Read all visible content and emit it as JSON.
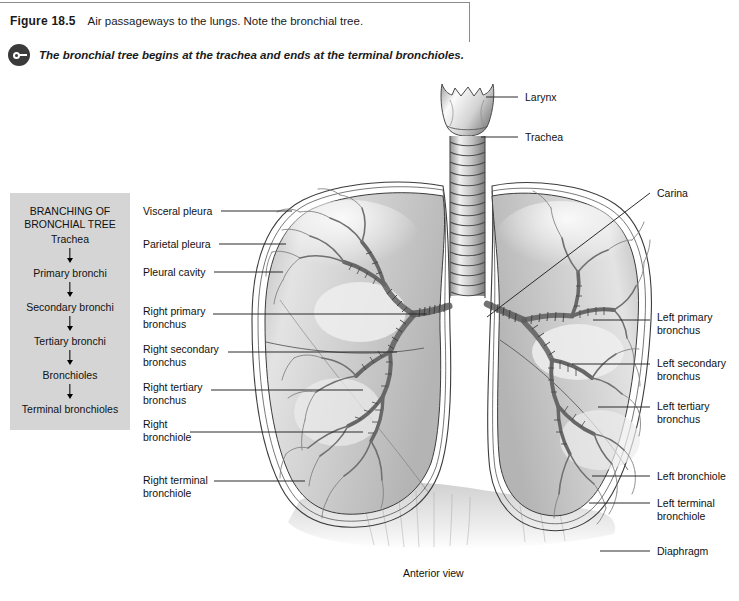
{
  "header": {
    "figure_number": "Figure 18.5",
    "caption": "Air passageways to the lungs. Note the bronchial tree.",
    "key_icon": "key-icon",
    "key_note": "The bronchial tree begins at the trachea and ends at the terminal bronchioles."
  },
  "branching_box": {
    "title_line1": "BRANCHING OF",
    "title_line2": "BRONCHIAL TREE",
    "steps": [
      "Trachea",
      "Primary bronchi",
      "Secondary bronchi",
      "Tertiary bronchi",
      "Bronchioles",
      "Terminal\nbronchioles"
    ]
  },
  "labels_left": [
    {
      "text": "Visceral pleura",
      "x": 143,
      "y": 205,
      "line_x1": 221,
      "line_y1": 211,
      "line_x2": 292,
      "line_y2": 211
    },
    {
      "text": "Parietal pleura",
      "x": 143,
      "y": 238,
      "line_x1": 219,
      "line_y1": 244,
      "line_x2": 286,
      "line_y2": 244
    },
    {
      "text": "Pleural cavity",
      "x": 143,
      "y": 266,
      "line_x1": 214,
      "line_y1": 272,
      "line_x2": 283,
      "line_y2": 272
    },
    {
      "text": "Right primary\nbronchus",
      "x": 143,
      "y": 305,
      "line_x1": 213,
      "line_y1": 314,
      "line_x2": 427,
      "line_y2": 314
    },
    {
      "text": "Right secondary\nbronchus",
      "x": 143,
      "y": 343,
      "line_x1": 228,
      "line_y1": 352,
      "line_x2": 397,
      "line_y2": 352
    },
    {
      "text": "Right tertiary\nbronchus",
      "x": 143,
      "y": 381,
      "line_x1": 211,
      "line_y1": 390,
      "line_x2": 363,
      "line_y2": 390
    },
    {
      "text": "Right\nbronchiole",
      "x": 143,
      "y": 418,
      "line_x1": 190,
      "line_y1": 432,
      "line_x2": 363,
      "line_y2": 432
    },
    {
      "text": "Right terminal\nbronchiole",
      "x": 143,
      "y": 474,
      "line_x1": 214,
      "line_y1": 481,
      "line_x2": 305,
      "line_y2": 481
    }
  ],
  "labels_right": [
    {
      "text": "Larynx",
      "x": 525,
      "y": 91,
      "line_x1": 486,
      "line_y1": 97,
      "line_x2": 518,
      "line_y2": 97
    },
    {
      "text": "Trachea",
      "x": 525,
      "y": 131,
      "line_x1": 481,
      "line_y1": 137,
      "line_x2": 518,
      "line_y2": 137
    },
    {
      "text": "Carina",
      "x": 657,
      "y": 187,
      "line_x1": 487,
      "line_y1": 317,
      "line_x2": 650,
      "line_y2": 193
    },
    {
      "text": "Left primary\nbronchus",
      "x": 657,
      "y": 311,
      "line_x1": 593,
      "line_y1": 320,
      "line_x2": 650,
      "line_y2": 320
    },
    {
      "text": "Left secondary\nbronchus",
      "x": 657,
      "y": 357,
      "line_x1": 572,
      "line_y1": 364,
      "line_x2": 650,
      "line_y2": 364
    },
    {
      "text": "Left tertiary\nbronchus",
      "x": 657,
      "y": 400,
      "line_x1": 598,
      "line_y1": 407,
      "line_x2": 650,
      "line_y2": 407
    },
    {
      "text": "Left bronchiole",
      "x": 657,
      "y": 470,
      "line_x1": 592,
      "line_y1": 476,
      "line_x2": 650,
      "line_y2": 476
    },
    {
      "text": "Left terminal\nbronchiole",
      "x": 657,
      "y": 497,
      "line_x1": 589,
      "line_y1": 503,
      "line_x2": 650,
      "line_y2": 503
    },
    {
      "text": "Diaphragm",
      "x": 657,
      "y": 545,
      "line_x1": 600,
      "line_y1": 551,
      "line_x2": 650,
      "line_y2": 551
    }
  ],
  "view_caption": "Anterior view",
  "colors": {
    "box_fill": "#d5d5d5",
    "leader_line": "#2b2b2b",
    "bracket": "#8c8c8c",
    "lung_fill": "#d8d8d8",
    "lung_outline": "#3c3c3c"
  }
}
